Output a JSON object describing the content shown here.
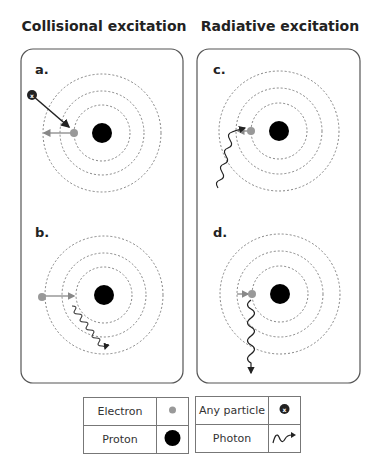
{
  "titles": {
    "left": "Collisional excitation",
    "right": "Radiative excitation"
  },
  "panels": {
    "a": {
      "label": "a.",
      "process": "collisional",
      "description": "Particle collides with electron, electron moves outward to higher orbit"
    },
    "b": {
      "label": "b.",
      "process": "collisional",
      "description": "Electron moves inward to lower orbit, emitting a photon"
    },
    "c": {
      "label": "c.",
      "process": "radiative",
      "description": "Photon absorbed by electron, electron moves outward"
    },
    "d": {
      "label": "d.",
      "process": "radiative",
      "description": "Electron moves inward, emitting a photon"
    }
  },
  "legend": {
    "electron": "Electron",
    "proton": "Proton",
    "any_particle": "Any particle",
    "photon": "Photon"
  },
  "colors": {
    "electron": "#999999",
    "proton": "#000000",
    "orbit": "#777777",
    "panel_border": "#555555",
    "arrow_gray": "#888888"
  }
}
